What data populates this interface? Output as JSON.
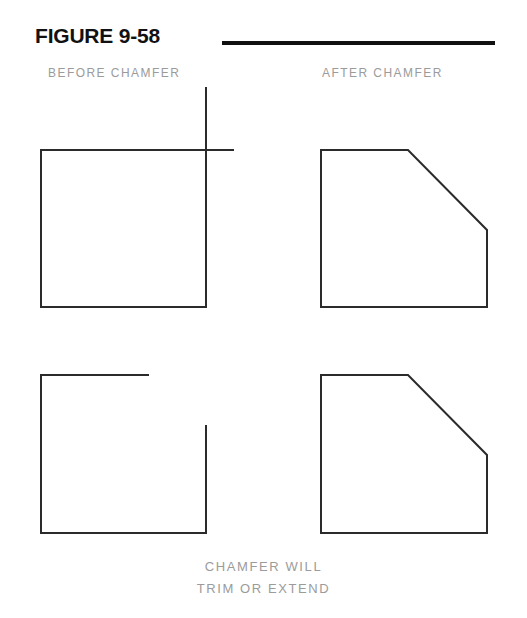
{
  "figure": {
    "title": "FIGURE 9-58",
    "rule_color": "#111111",
    "line_color": "#2b2b2b",
    "label_color": "#9b9b9b",
    "background": "#ffffff"
  },
  "labels": {
    "before": "BEFORE  CHAMFER",
    "after": "AFTER  CHAMFER"
  },
  "caption": {
    "line1": "CHAMFER  WILL",
    "line2": "TRIM  OR  EXTEND"
  },
  "diagram_data": {
    "type": "technical-line-drawing",
    "subject": "CAD chamfer command: trimming and extending corner lines",
    "units": "screen pixels",
    "shapes": [
      {
        "name": "before-chamfer-overlapping-corner",
        "column": "before",
        "row": "top",
        "description": "Square whose top and right edges overshoot past the corner and cross each other",
        "segments": [
          {
            "name": "left-edge",
            "x1": 41,
            "y1": 150,
            "x2": 41,
            "y2": 307
          },
          {
            "name": "bottom-edge",
            "x1": 41,
            "y1": 307,
            "x2": 206,
            "y2": 307
          },
          {
            "name": "right-edge-overshoot",
            "x1": 206,
            "y1": 88,
            "x2": 206,
            "y2": 307
          },
          {
            "name": "top-edge-overshoot",
            "x1": 41,
            "y1": 150,
            "x2": 233,
            "y2": 150
          }
        ],
        "overshoot": {
          "vertical_above_corner": 62,
          "horizontal_past_corner": 27
        }
      },
      {
        "name": "after-chamfer-from-overlap",
        "column": "after",
        "row": "top",
        "description": "Chamfered polygon; corner replaced by a 45-degree bevel",
        "polygon": [
          {
            "x": 321,
            "y": 150
          },
          {
            "x": 408,
            "y": 150
          },
          {
            "x": 487,
            "y": 230
          },
          {
            "x": 487,
            "y": 307
          },
          {
            "x": 321,
            "y": 307
          }
        ]
      },
      {
        "name": "before-chamfer-gapped-corner",
        "column": "before",
        "row": "bottom",
        "description": "Square with a gap at the corner: top edge stops short and right edge starts low",
        "segments": [
          {
            "name": "left-edge",
            "x1": 41,
            "y1": 375,
            "x2": 41,
            "y2": 533
          },
          {
            "name": "bottom-edge",
            "x1": 41,
            "y1": 533,
            "x2": 206,
            "y2": 533
          },
          {
            "name": "top-edge-short",
            "x1": 41,
            "y1": 375,
            "x2": 148,
            "y2": 375
          },
          {
            "name": "right-edge-short",
            "x1": 206,
            "y1": 426,
            "x2": 206,
            "y2": 533
          }
        ],
        "gap": {
          "horizontal_missing": 58,
          "vertical_missing": 51
        }
      },
      {
        "name": "after-chamfer-from-gap",
        "column": "after",
        "row": "bottom",
        "description": "Chamfered polygon; the short edges were extended and beveled",
        "polygon": [
          {
            "x": 321,
            "y": 375
          },
          {
            "x": 408,
            "y": 375
          },
          {
            "x": 487,
            "y": 455
          },
          {
            "x": 487,
            "y": 533
          },
          {
            "x": 321,
            "y": 533
          }
        ]
      }
    ],
    "rule": {
      "x1": 222,
      "y1": 43,
      "x2": 495,
      "y2": 43,
      "thickness": 4
    }
  }
}
